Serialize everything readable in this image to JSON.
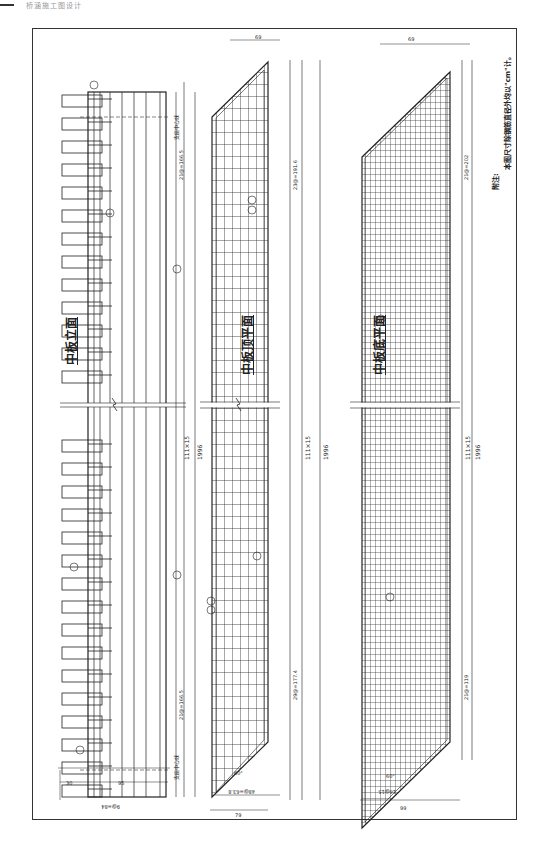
{
  "header": {
    "label": "桥涵施工图设计"
  },
  "drawing": {
    "views": [
      {
        "title": "中板立面",
        "dims": {
          "total": "1996",
          "mid": "111×15",
          "top_seg": "23.5",
          "top_split": "21@=166.5",
          "bot_split": "21@=166.5",
          "bot_seg": "23.5",
          "width": "95",
          "side": "30",
          "bars": "9@=84",
          "small": [
            "15",
            "10",
            "15",
            "18"
          ],
          "support_label": "支座中心线"
        },
        "callouts": [
          "12",
          "11",
          "13",
          "14",
          "8/9"
        ]
      },
      {
        "title": "中板顶平面",
        "dims": {
          "total": "1996",
          "mid": "111×15",
          "top_split": "23@=191.6",
          "bot_split": "29@=177.4",
          "width_top": "69",
          "width_bot": "79",
          "bars_bot": "48@=63.8",
          "angle": "60°",
          "edge_small": [
            "2.4",
            "5.2",
            "5",
            "5.2",
            "2.4"
          ]
        },
        "callouts": [
          "14",
          "15",
          "13",
          "15",
          "16"
        ]
      },
      {
        "title": "中板底平面",
        "dims": {
          "total": "1996",
          "mid": "111×15",
          "top_split": "21@=202",
          "bot_split": "21@=119",
          "width_top": [
            "15",
            "69",
            "15"
          ],
          "width_bot": "99",
          "bars_bot": "16@15",
          "angle": "60°",
          "edge_small": [
            "5",
            "4.5",
            "4.5",
            "5"
          ]
        },
        "callouts": [
          "11",
          "13"
        ]
      }
    ],
    "note": {
      "title": "附注:",
      "text": "本图尺寸除钢筋直径外均以\"cm\"计。"
    }
  }
}
